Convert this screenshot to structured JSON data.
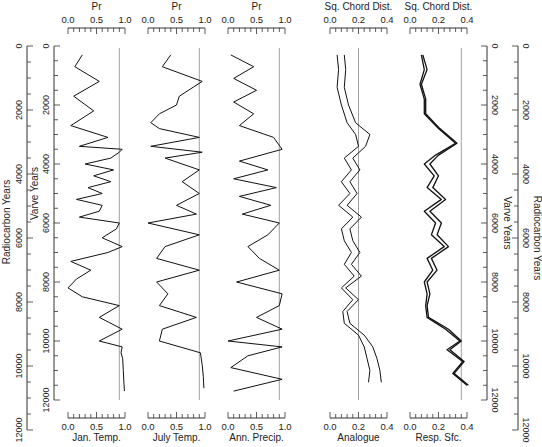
{
  "chart_data": {
    "type": "line",
    "layout": "stratigraphic diagram, depth axis vertical (time increasing downward), 5 panels",
    "y_axes": {
      "left_outer": {
        "label": "Radiocarbon Years",
        "ticks": [
          0,
          2000,
          4000,
          6000,
          8000,
          10000,
          12000
        ],
        "range": [
          0,
          12000
        ]
      },
      "left_inner": {
        "label": "Varve Years",
        "ticks": [
          0,
          2000,
          4000,
          6000,
          8000,
          10000,
          12000
        ],
        "range": [
          0,
          12000
        ]
      },
      "right_inner": {
        "label": "Varve Years",
        "ticks": [
          0,
          2000,
          4000,
          6000,
          8000,
          10000,
          12000
        ],
        "range": [
          0,
          12000
        ]
      },
      "right_outer": {
        "label": "Radiocarbon Years",
        "ticks": [
          0,
          2000,
          4000,
          6000,
          8000,
          10000,
          12000
        ],
        "range": [
          0,
          12000
        ]
      }
    },
    "panels": [
      {
        "id": "jan",
        "top_label": "Pr",
        "bottom_label": "Jan. Temp.",
        "xlim": [
          0,
          1.0
        ],
        "xticks": [
          "0.0",
          "0.5",
          "1.0"
        ],
        "reference_line": 0.9,
        "series": [
          {
            "name": "Jan. Temp. Pr",
            "x_varve_years": [
              300,
              700,
              1200,
              1700,
              2200,
              2700,
              3100,
              3400,
              3500,
              3600,
              3800,
              4000,
              4200,
              4400,
              4600,
              4800,
              5000,
              5200,
              5400,
              5600,
              5800,
              6000,
              6200,
              6500,
              6800,
              7000,
              7300,
              7600,
              7900,
              8200,
              8500,
              8800,
              9200,
              9600,
              10000,
              10200,
              10400,
              10600,
              11000,
              11400,
              11700
            ],
            "values": [
              0.25,
              0.12,
              0.55,
              0.1,
              0.45,
              0.05,
              0.7,
              0.2,
              0.95,
              0.9,
              0.75,
              0.3,
              0.8,
              0.45,
              0.75,
              0.35,
              0.6,
              0.15,
              0.6,
              0.55,
              0.2,
              0.9,
              0.85,
              0.6,
              0.95,
              0.7,
              0.05,
              0.4,
              0.15,
              0.0,
              0.25,
              0.9,
              0.55,
              0.95,
              0.55,
              0.95,
              0.93,
              0.96,
              0.97,
              0.98,
              0.99
            ]
          }
        ]
      },
      {
        "id": "july",
        "top_label": "Pr",
        "bottom_label": "July Temp.",
        "xlim": [
          0,
          1.0
        ],
        "xticks": [
          "0.0",
          "0.5",
          "1.0"
        ],
        "reference_line": 0.9,
        "series": [
          {
            "name": "July Temp. Pr",
            "x_varve_years": [
              300,
              700,
              1200,
              1700,
              2000,
              2300,
              2600,
              2800,
              3100,
              3400,
              3600,
              3800,
              4200,
              4600,
              5000,
              5400,
              5700,
              6000,
              6400,
              6800,
              7200,
              7600,
              8000,
              8400,
              8800,
              9200,
              9600,
              10000,
              10400,
              10800,
              11200,
              11600
            ],
            "values": [
              0.4,
              0.25,
              0.95,
              0.55,
              0.5,
              0.2,
              0.05,
              0.2,
              0.9,
              0.05,
              0.95,
              0.3,
              0.9,
              0.6,
              0.9,
              0.5,
              0.85,
              0.0,
              0.9,
              0.3,
              0.15,
              0.9,
              0.15,
              0.35,
              0.2,
              0.85,
              0.25,
              0.2,
              0.92,
              0.95,
              0.97,
              0.98
            ]
          }
        ]
      },
      {
        "id": "ann",
        "top_label": "Pr",
        "bottom_label": "Ann. Precip.",
        "xlim": [
          0,
          1.0
        ],
        "xticks": [
          "0.0",
          "0.5",
          "1.0"
        ],
        "reference_line": 0.9,
        "series": [
          {
            "name": "Ann. Precip. Pr",
            "x_varve_years": [
              300,
              700,
              1100,
              1500,
              1900,
              2300,
              2700,
              3100,
              3500,
              3900,
              4200,
              4500,
              4800,
              5100,
              5400,
              5700,
              6000,
              6400,
              6800,
              7200,
              7600,
              8000,
              8400,
              8800,
              9200,
              9600,
              10000,
              10200,
              10500,
              10900,
              11300,
              11700
            ],
            "values": [
              0.05,
              0.45,
              0.1,
              0.5,
              0.1,
              0.45,
              0.2,
              0.8,
              0.95,
              0.2,
              0.7,
              0.1,
              0.85,
              0.2,
              0.75,
              0.25,
              0.9,
              0.7,
              0.35,
              0.55,
              0.9,
              0.15,
              0.95,
              0.9,
              0.5,
              0.95,
              0.0,
              0.95,
              0.35,
              0.05,
              0.95,
              0.1
            ]
          }
        ]
      },
      {
        "id": "analogue",
        "top_label": "Sq. Chord Dist.",
        "bottom_label": "Analogue",
        "xlim": [
          0,
          0.4
        ],
        "xticks": [
          "0.0",
          "0.2",
          "0.4"
        ],
        "reference_line": 0.2,
        "series": [
          {
            "name": "Analogue (lower bound)",
            "x_varve_years": [
              300,
              800,
              1400,
              2000,
              2600,
              3000,
              3400,
              3800,
              4200,
              4600,
              5000,
              5400,
              5800,
              6200,
              6600,
              7000,
              7400,
              7800,
              8200,
              8600,
              9000,
              9400,
              9800,
              10200,
              10600,
              11000,
              11400
            ],
            "values": [
              0.05,
              0.06,
              0.05,
              0.08,
              0.12,
              0.18,
              0.2,
              0.1,
              0.15,
              0.08,
              0.14,
              0.06,
              0.16,
              0.08,
              0.1,
              0.15,
              0.1,
              0.17,
              0.08,
              0.16,
              0.09,
              0.1,
              0.2,
              0.24,
              0.26,
              0.28,
              0.27
            ]
          },
          {
            "name": "Analogue (upper bound)",
            "x_varve_years": [
              300,
              800,
              1400,
              2000,
              2600,
              3000,
              3400,
              3800,
              4200,
              4600,
              5000,
              5400,
              5800,
              6200,
              6600,
              7000,
              7400,
              7800,
              8200,
              8600,
              9000,
              9400,
              9800,
              10200,
              10600,
              11000,
              11400
            ],
            "values": [
              0.1,
              0.11,
              0.1,
              0.13,
              0.18,
              0.28,
              0.25,
              0.16,
              0.21,
              0.14,
              0.19,
              0.12,
              0.22,
              0.14,
              0.16,
              0.21,
              0.15,
              0.22,
              0.11,
              0.2,
              0.12,
              0.14,
              0.24,
              0.3,
              0.33,
              0.35,
              0.36
            ]
          }
        ]
      },
      {
        "id": "resp",
        "top_label": "Sq. Chord Dist.",
        "bottom_label": "Resp. Sfc.",
        "xlim": [
          0,
          0.4
        ],
        "xticks": [
          "0.0",
          "0.2",
          "0.4"
        ],
        "reference_line": 0.36,
        "series": [
          {
            "name": "Resp. Sfc. (a)",
            "x_varve_years": [
              300,
              800,
              1300,
              1800,
              2300,
              2800,
              3300,
              3700,
              4000,
              4400,
              4800,
              5200,
              5600,
              6000,
              6400,
              6800,
              7200,
              7600,
              8000,
              8400,
              8800,
              9200,
              9600,
              10000,
              10300,
              10700,
              11100,
              11500
            ],
            "values": [
              0.08,
              0.1,
              0.07,
              0.1,
              0.1,
              0.2,
              0.32,
              0.18,
              0.1,
              0.17,
              0.12,
              0.22,
              0.1,
              0.18,
              0.15,
              0.24,
              0.12,
              0.16,
              0.1,
              0.12,
              0.11,
              0.12,
              0.25,
              0.35,
              0.26,
              0.37,
              0.3,
              0.4
            ]
          },
          {
            "name": "Resp. Sfc. (b)",
            "x_varve_years": [
              300,
              800,
              1300,
              1800,
              2300,
              2800,
              3300,
              3700,
              4000,
              4400,
              4800,
              5200,
              5600,
              6000,
              6400,
              6800,
              7200,
              7600,
              8000,
              8400,
              8800,
              9200,
              9600,
              10000,
              10300,
              10700,
              11100,
              11500
            ],
            "values": [
              0.09,
              0.12,
              0.08,
              0.11,
              0.11,
              0.21,
              0.33,
              0.2,
              0.14,
              0.2,
              0.16,
              0.25,
              0.14,
              0.22,
              0.19,
              0.27,
              0.15,
              0.19,
              0.12,
              0.14,
              0.12,
              0.13,
              0.27,
              0.36,
              0.28,
              0.38,
              0.31,
              0.41
            ]
          }
        ]
      }
    ],
    "title": "",
    "grid": false,
    "legend": "none"
  },
  "labels": {
    "radiocarbon": "Radiocarbon Years",
    "varve": "Varve Years",
    "tick_0": "0",
    "tick_2000": "2000",
    "tick_4000": "4000",
    "tick_6000": "6000",
    "tick_8000": "8000",
    "tick_10000": "10000",
    "tick_12000": "12000"
  }
}
